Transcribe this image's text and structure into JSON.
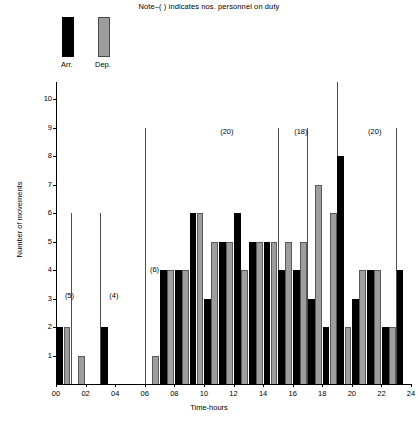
{
  "note": "Note–( ) indicates nos. personnel on duty",
  "legend": {
    "arr_label": "Arr.",
    "dep_label": "Dep.",
    "arr_color": "#000000",
    "dep_color": "#9d9d9d"
  },
  "chart_data": {
    "type": "bar",
    "title": "Note–( ) indicates nos. personnel on duty",
    "xlabel": "Time-hours",
    "ylabel": "Number of movements",
    "ylim": [
      0,
      10
    ],
    "yticks": [
      0,
      1,
      2,
      3,
      4,
      5,
      6,
      7,
      8,
      9,
      10
    ],
    "xlim": [
      0,
      24
    ],
    "xticks": [
      "00",
      "02",
      "04",
      "06",
      "08",
      "10",
      "12",
      "14",
      "16",
      "18",
      "20",
      "22",
      "24"
    ],
    "grid": false,
    "legend_position": "top-left",
    "hours": [
      "00-01",
      "01-02",
      "02-03",
      "03-04",
      "04-05",
      "05-06",
      "06-07",
      "07-08",
      "08-09",
      "09-10",
      "10-11",
      "11-12",
      "12-13",
      "13-14",
      "14-15",
      "15-16",
      "16-17",
      "17-18",
      "18-19",
      "19-20",
      "20-21",
      "21-22",
      "22-23",
      "23-24"
    ],
    "series": [
      {
        "name": "Arr.",
        "color": "#000000",
        "values": [
          2,
          0,
          0,
          2,
          0,
          0,
          0,
          4,
          4,
          6,
          3,
          5,
          6,
          5,
          5,
          4,
          4,
          3,
          2,
          8,
          3,
          4,
          2,
          4
        ]
      },
      {
        "name": "Dep.",
        "color": "#9d9d9d",
        "values": [
          2,
          1,
          0,
          0,
          0,
          0,
          1,
          4,
          4,
          6,
          5,
          5,
          4,
          5,
          5,
          5,
          5,
          7,
          6,
          2,
          4,
          4,
          2,
          0
        ]
      }
    ],
    "annotations": [
      {
        "label": "(5)",
        "hour": 0.6,
        "y": 3.1
      },
      {
        "label": "(4)",
        "hour": 3.6,
        "y": 3.1
      },
      {
        "label": "(6)",
        "hour": 6.35,
        "y": 4.0
      },
      {
        "label": "(20)",
        "hour": 11.1,
        "y": 8.85
      },
      {
        "label": "(18)",
        "hour": 16.1,
        "y": 8.85
      },
      {
        "label": "(20)",
        "hour": 21.1,
        "y": 8.85
      }
    ],
    "dividers": [
      {
        "hour": 1.0,
        "top_value": 6.0
      },
      {
        "hour": 3.0,
        "top_value": 6.0
      },
      {
        "hour": 6.0,
        "top_value": 9.0
      },
      {
        "hour": 15.0,
        "top_value": 9.0
      },
      {
        "hour": 17.0,
        "top_value": 9.0
      },
      {
        "hour": 19.0,
        "top_value": 10.6
      },
      {
        "hour": 23.0,
        "top_value": 9.0
      }
    ]
  }
}
